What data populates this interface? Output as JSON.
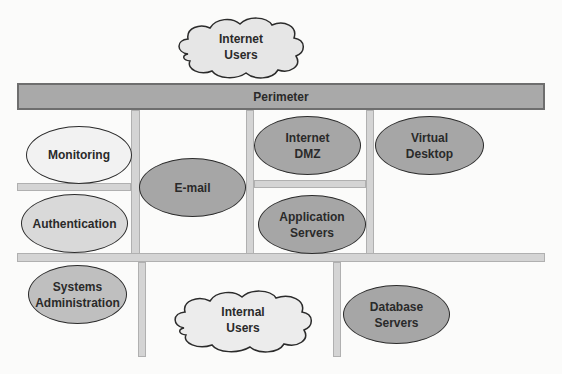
{
  "diagram": {
    "perimeter": {
      "label": "Perimeter",
      "fill": "#a9a9a9"
    },
    "clouds": [
      {
        "id": "internet-users",
        "label": "Internet\nUsers"
      },
      {
        "id": "internal-users",
        "label": "Internal\nUsers"
      }
    ],
    "zones": [
      {
        "id": "monitoring",
        "label": "Monitoring",
        "fill": "#f2f2f2"
      },
      {
        "id": "authentication",
        "label": "Authentication",
        "fill": "#d9d9d9"
      },
      {
        "id": "e-mail",
        "label": "E-mail",
        "fill": "#a6a6a6"
      },
      {
        "id": "internet-dmz",
        "label": "Internet\nDMZ",
        "fill": "#a6a6a6"
      },
      {
        "id": "virtual-desktop",
        "label": "Virtual\nDesktop",
        "fill": "#a6a6a6"
      },
      {
        "id": "application-servers",
        "label": "Application\nServers",
        "fill": "#a6a6a6"
      },
      {
        "id": "systems-administration",
        "label": "Systems\nAdministration",
        "fill": "#bfbfbf"
      },
      {
        "id": "database-servers",
        "label": "Database\nServers",
        "fill": "#a6a6a6"
      }
    ],
    "connectors": {
      "fill": "#d4d4d4"
    }
  }
}
